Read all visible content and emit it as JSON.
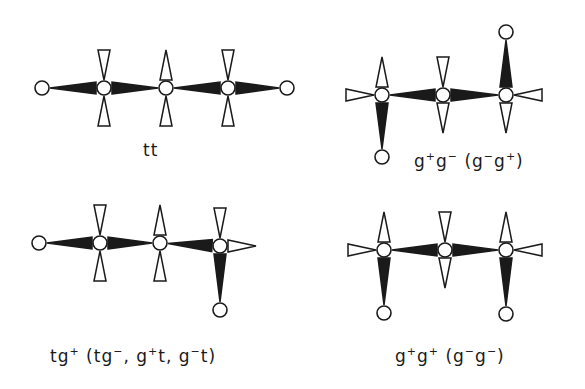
{
  "figure": {
    "colors": {
      "ink": "#1a1a1a",
      "background": "#ffffff"
    },
    "atom_radius": 7,
    "diagrams": [
      {
        "id": "tt",
        "label": "tt",
        "label_pos": [
          140,
          140
        ],
        "atoms": [
          [
            42,
            88
          ],
          [
            104,
            88
          ],
          [
            166,
            88
          ],
          [
            228,
            88
          ],
          [
            287,
            88
          ]
        ],
        "bonds": [
          {
            "from": [
              42,
              88
            ],
            "to": [
              104,
              88
            ],
            "type": "solid",
            "wide_end": "to"
          },
          {
            "from": [
              104,
              88
            ],
            "to": [
              166,
              88
            ],
            "type": "solid",
            "wide_end": "from"
          },
          {
            "from": [
              166,
              88
            ],
            "to": [
              228,
              88
            ],
            "type": "solid",
            "wide_end": "to"
          },
          {
            "from": [
              228,
              88
            ],
            "to": [
              287,
              88
            ],
            "type": "solid",
            "wide_end": "from"
          }
        ],
        "hashed": [
          {
            "at": [
              104,
              88
            ],
            "dir": "up",
            "wide_end": "far"
          },
          {
            "at": [
              104,
              88
            ],
            "dir": "down",
            "wide_end": "far"
          },
          {
            "at": [
              166,
              88
            ],
            "dir": "up",
            "wide_end": "near"
          },
          {
            "at": [
              166,
              88
            ],
            "dir": "down",
            "wide_end": "far"
          },
          {
            "at": [
              228,
              88
            ],
            "dir": "up",
            "wide_end": "far"
          },
          {
            "at": [
              228,
              88
            ],
            "dir": "down",
            "wide_end": "far"
          }
        ]
      },
      {
        "id": "g+g-",
        "label": "g⁺g⁻ (g⁻g⁺)",
        "label_parts": [
          [
            "g",
            "+"
          ],
          [
            "g",
            "−"
          ],
          [
            " (g",
            "−"
          ],
          [
            "g",
            "+"
          ],
          [
            ")",
            ""
          ]
        ],
        "label_pos": [
          414,
          150
        ],
        "atoms": [
          [
            382,
            95
          ],
          [
            443,
            95
          ],
          [
            506,
            95
          ],
          [
            382,
            157
          ],
          [
            506,
            32
          ]
        ],
        "bonds": [
          {
            "from": [
              382,
              95
            ],
            "to": [
              443,
              95
            ],
            "type": "solid",
            "wide_end": "to"
          },
          {
            "from": [
              443,
              95
            ],
            "to": [
              506,
              95
            ],
            "type": "solid",
            "wide_end": "from"
          },
          {
            "from": [
              382,
              95
            ],
            "to": [
              382,
              157
            ],
            "type": "solid",
            "wide_end": "from"
          },
          {
            "from": [
              506,
              95
            ],
            "to": [
              506,
              32
            ],
            "type": "solid",
            "wide_end": "from"
          }
        ],
        "hashed": [
          {
            "at": [
              382,
              95
            ],
            "dir": "up",
            "wide_end": "near"
          },
          {
            "at": [
              382,
              95
            ],
            "dir": "left",
            "wide_end": "far"
          },
          {
            "at": [
              443,
              95
            ],
            "dir": "up",
            "wide_end": "far"
          },
          {
            "at": [
              443,
              95
            ],
            "dir": "down",
            "wide_end": "near"
          },
          {
            "at": [
              506,
              95
            ],
            "dir": "right",
            "wide_end": "far"
          },
          {
            "at": [
              506,
              95
            ],
            "dir": "down",
            "wide_end": "near"
          }
        ]
      },
      {
        "id": "tg+",
        "label": "tg⁺ (tg⁻, g⁺t, g⁻t)",
        "label_parts": [
          [
            "tg",
            "+"
          ],
          [
            " (tg",
            "−"
          ],
          [
            ", g",
            "+"
          ],
          [
            "t, g",
            "−"
          ],
          [
            "t)",
            ""
          ]
        ],
        "label_pos": [
          50,
          345
        ],
        "atoms": [
          [
            39,
            243
          ],
          [
            100,
            243
          ],
          [
            160,
            243
          ],
          [
            220,
            246
          ],
          [
            220,
            310
          ]
        ],
        "bonds": [
          {
            "from": [
              39,
              243
            ],
            "to": [
              100,
              243
            ],
            "type": "solid",
            "wide_end": "to"
          },
          {
            "from": [
              100,
              243
            ],
            "to": [
              160,
              243
            ],
            "type": "solid",
            "wide_end": "from"
          },
          {
            "from": [
              160,
              243
            ],
            "to": [
              220,
              246
            ],
            "type": "solid",
            "wide_end": "to"
          },
          {
            "from": [
              220,
              246
            ],
            "to": [
              220,
              310
            ],
            "type": "solid",
            "wide_end": "from"
          }
        ],
        "hashed": [
          {
            "at": [
              100,
              243
            ],
            "dir": "up",
            "wide_end": "far"
          },
          {
            "at": [
              100,
              243
            ],
            "dir": "down",
            "wide_end": "far"
          },
          {
            "at": [
              160,
              243
            ],
            "dir": "up",
            "wide_end": "near"
          },
          {
            "at": [
              160,
              243
            ],
            "dir": "down",
            "wide_end": "far"
          },
          {
            "at": [
              220,
              246
            ],
            "dir": "up",
            "wide_end": "far"
          },
          {
            "at": [
              220,
              246
            ],
            "dir": "right",
            "wide_end": "near"
          }
        ]
      },
      {
        "id": "g+g+",
        "label": "g⁺g⁺ (g⁻g⁻)",
        "label_parts": [
          [
            "g",
            "+"
          ],
          [
            "g",
            "+"
          ],
          [
            " (g",
            "−"
          ],
          [
            "g",
            "−"
          ],
          [
            ")",
            ""
          ]
        ],
        "label_pos": [
          395,
          345
        ],
        "atoms": [
          [
            384,
            250
          ],
          [
            445,
            250
          ],
          [
            506,
            250
          ],
          [
            384,
            313
          ],
          [
            506,
            314
          ]
        ],
        "bonds": [
          {
            "from": [
              384,
              250
            ],
            "to": [
              445,
              250
            ],
            "type": "solid",
            "wide_end": "to"
          },
          {
            "from": [
              445,
              250
            ],
            "to": [
              506,
              250
            ],
            "type": "solid",
            "wide_end": "from"
          },
          {
            "from": [
              384,
              250
            ],
            "to": [
              384,
              313
            ],
            "type": "solid",
            "wide_end": "from"
          },
          {
            "from": [
              506,
              250
            ],
            "to": [
              506,
              314
            ],
            "type": "solid",
            "wide_end": "from"
          }
        ],
        "hashed": [
          {
            "at": [
              384,
              250
            ],
            "dir": "up",
            "wide_end": "near"
          },
          {
            "at": [
              384,
              250
            ],
            "dir": "left",
            "wide_end": "far"
          },
          {
            "at": [
              445,
              250
            ],
            "dir": "up",
            "wide_end": "far"
          },
          {
            "at": [
              445,
              250
            ],
            "dir": "down",
            "wide_end": "near"
          },
          {
            "at": [
              506,
              250
            ],
            "dir": "up",
            "wide_end": "near"
          },
          {
            "at": [
              506,
              250
            ],
            "dir": "right",
            "wide_end": "far"
          }
        ]
      }
    ]
  }
}
